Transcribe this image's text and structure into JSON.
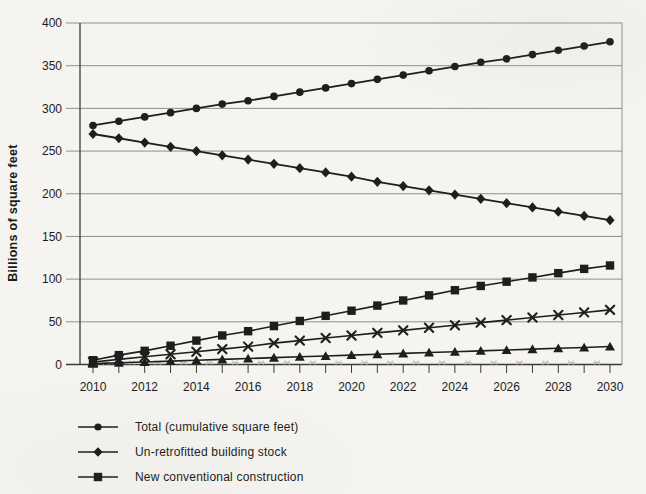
{
  "figure": {
    "background_color": "#f5f4f0",
    "ink_color": "#1e1e1e",
    "gridline_color": "#8f8f8f",
    "axis_color": "#3a3a3a",
    "ghost_color": "#c6c2b8"
  },
  "chart_data": {
    "type": "line",
    "title": "",
    "ylabel": "Billions of square feet",
    "xlabel": "",
    "x": [
      2010,
      2011,
      2012,
      2013,
      2014,
      2015,
      2016,
      2017,
      2018,
      2019,
      2020,
      2021,
      2022,
      2023,
      2024,
      2025,
      2026,
      2027,
      2028,
      2029,
      2030
    ],
    "x_label_every": 2,
    "ylim": [
      0,
      400
    ],
    "ytick_step": 50,
    "grid": "horizontal",
    "legend_position": "bottom-left",
    "series": [
      {
        "name": "Total (cumulative square feet)",
        "marker": "circle",
        "in_legend": true,
        "values": [
          280,
          285,
          290,
          295,
          300,
          305,
          309,
          314,
          319,
          324,
          329,
          334,
          339,
          344,
          349,
          354,
          358,
          363,
          368,
          373,
          378
        ]
      },
      {
        "name": "Un-retrofitted building stock",
        "marker": "diamond",
        "in_legend": true,
        "values": [
          270,
          265,
          260,
          255,
          250,
          245,
          240,
          235,
          230,
          225,
          220,
          214,
          209,
          204,
          199,
          194,
          189,
          184,
          179,
          174,
          169
        ]
      },
      {
        "name": "New conventional construction",
        "marker": "square",
        "in_legend": true,
        "values": [
          5,
          11,
          16,
          22,
          28,
          34,
          39,
          45,
          51,
          57,
          63,
          69,
          75,
          81,
          87,
          92,
          97,
          102,
          107,
          112,
          116
        ]
      },
      {
        "name": "",
        "marker": "x",
        "in_legend": false,
        "values": [
          3,
          6,
          9,
          12,
          15,
          18,
          21,
          25,
          28,
          31,
          34,
          37,
          40,
          43,
          46,
          49,
          52,
          55,
          58,
          61,
          64
        ]
      },
      {
        "name": "",
        "marker": "triangle",
        "in_legend": false,
        "values": [
          1,
          2,
          3,
          4,
          5,
          6,
          7,
          8,
          9,
          10,
          11,
          12,
          13,
          14,
          15,
          16,
          17,
          18,
          19,
          20,
          21
        ]
      }
    ],
    "scan_artifacts": {
      "ghost_marker_row": {
        "value": 1,
        "positions": "half-year offsets along baseline",
        "color": "#c6c2b8"
      }
    }
  }
}
